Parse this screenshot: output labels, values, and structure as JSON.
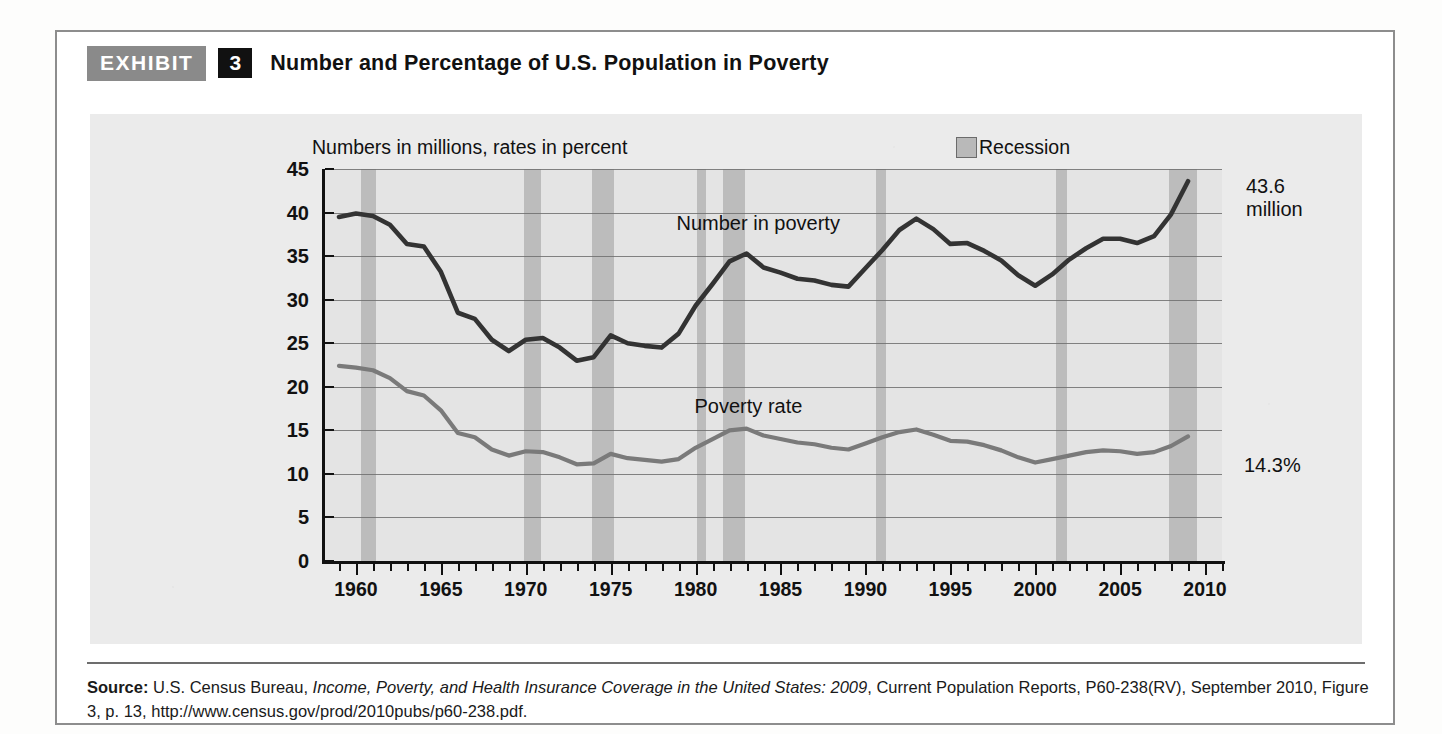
{
  "exhibit": {
    "tag": "EXHIBIT",
    "number": "3",
    "title": "Number and Percentage of U.S. Population in Poverty"
  },
  "legend": {
    "recession_label": "Recession",
    "recession_color": "#b9b9b9"
  },
  "annotations": {
    "number_end_value": "43.6",
    "number_end_unit": "million",
    "rate_end_value": "14.3%"
  },
  "source": {
    "prefix": "Source:",
    "agency": " U.S. Census Bureau, ",
    "italic_title": "Income, Poverty, and Health Insurance Coverage in the United States: 2009",
    "rest": ", Current Population Reports, P60-238(RV), September 2010, Figure 3, p. 13, http://www.census.gov/prod/2010pubs/p60-238.pdf."
  },
  "chart_data": {
    "type": "line",
    "title": "Number and Percentage of U.S. Population in Poverty",
    "subtitle": "Numbers in millions, rates in percent",
    "xlabel": "",
    "ylabel": "",
    "xlim": [
      1958,
      2011
    ],
    "ylim": [
      0,
      45
    ],
    "ytick_step": 5,
    "yticks": [
      0,
      5,
      10,
      15,
      20,
      25,
      30,
      35,
      40,
      45
    ],
    "xticks": [
      1960,
      1965,
      1970,
      1975,
      1980,
      1985,
      1990,
      1995,
      2000,
      2005,
      2010
    ],
    "xtick_minor_step": 1,
    "grid": "horizontal",
    "legend_position": "top-right",
    "colors": {
      "number_in_poverty": "#333333",
      "poverty_rate": "#7a7a7a",
      "recession_band": "#bcbcbc",
      "plot_background": "#e4e4e4"
    },
    "x": [
      1959,
      1960,
      1961,
      1962,
      1963,
      1964,
      1965,
      1966,
      1967,
      1968,
      1969,
      1970,
      1971,
      1972,
      1973,
      1974,
      1975,
      1976,
      1977,
      1978,
      1979,
      1980,
      1981,
      1982,
      1983,
      1984,
      1985,
      1986,
      1987,
      1988,
      1989,
      1990,
      1991,
      1992,
      1993,
      1994,
      1995,
      1996,
      1997,
      1998,
      1999,
      2000,
      2001,
      2002,
      2003,
      2004,
      2005,
      2006,
      2007,
      2008,
      2009
    ],
    "series": [
      {
        "name": "Number in poverty",
        "unit": "millions",
        "color": "#333333",
        "label_x": 1983,
        "label_y": 38.5,
        "values": [
          39.5,
          39.9,
          39.6,
          38.6,
          36.4,
          36.1,
          33.2,
          28.5,
          27.8,
          25.4,
          24.1,
          25.4,
          25.6,
          24.5,
          23.0,
          23.4,
          25.9,
          25.0,
          24.7,
          24.5,
          26.1,
          29.3,
          31.8,
          34.4,
          35.3,
          33.7,
          33.1,
          32.4,
          32.2,
          31.7,
          31.5,
          33.6,
          35.7,
          38.0,
          39.3,
          38.1,
          36.4,
          36.5,
          35.6,
          34.5,
          32.8,
          31.6,
          32.9,
          34.6,
          35.9,
          37.0,
          37.0,
          36.5,
          37.3,
          39.8,
          43.6
        ]
      },
      {
        "name": "Poverty rate",
        "unit": "percent",
        "color": "#7a7a7a",
        "label_x": 1983,
        "label_y": 17.5,
        "values": [
          22.4,
          22.2,
          21.9,
          21.0,
          19.5,
          19.0,
          17.3,
          14.7,
          14.2,
          12.8,
          12.1,
          12.6,
          12.5,
          11.9,
          11.1,
          11.2,
          12.3,
          11.8,
          11.6,
          11.4,
          11.7,
          13.0,
          14.0,
          15.0,
          15.2,
          14.4,
          14.0,
          13.6,
          13.4,
          13.0,
          12.8,
          13.5,
          14.2,
          14.8,
          15.1,
          14.5,
          13.8,
          13.7,
          13.3,
          12.7,
          11.9,
          11.3,
          11.7,
          12.1,
          12.5,
          12.7,
          12.6,
          12.3,
          12.5,
          13.2,
          14.3
        ]
      }
    ],
    "recession_bands": [
      {
        "start": 1960.3,
        "end": 1961.2
      },
      {
        "start": 1969.9,
        "end": 1970.9
      },
      {
        "start": 1973.9,
        "end": 1975.2
      },
      {
        "start": 1980.1,
        "end": 1980.6
      },
      {
        "start": 1981.6,
        "end": 1982.9
      },
      {
        "start": 1990.6,
        "end": 1991.2
      },
      {
        "start": 2001.2,
        "end": 2001.9
      },
      {
        "start": 2007.9,
        "end": 2009.5
      }
    ]
  }
}
